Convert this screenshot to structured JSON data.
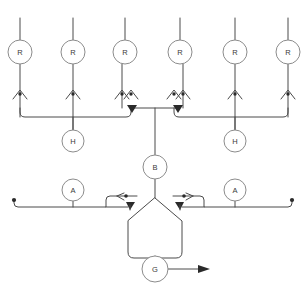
{
  "diagram": {
    "type": "schematic",
    "background_color": "#ffffff",
    "line_color": "#4a4a4a",
    "node_stroke_color": "#8c8c8c",
    "node_fill_color": "#ffffff",
    "label_color": "#3a3a3a",
    "stroke_width": 1
  },
  "nodes": {
    "top_row": [
      {
        "label": "R",
        "cx": 20,
        "cy": 52,
        "r": 12
      },
      {
        "label": "R",
        "cx": 73,
        "cy": 52,
        "r": 12
      },
      {
        "label": "R",
        "cx": 125,
        "cy": 52,
        "r": 12
      },
      {
        "label": "R",
        "cx": 180,
        "cy": 52,
        "r": 12
      },
      {
        "label": "R",
        "cx": 235,
        "cy": 52,
        "r": 12
      },
      {
        "label": "R",
        "cx": 288,
        "cy": 52,
        "r": 12
      }
    ],
    "h_row": [
      {
        "label": "H",
        "cx": 73,
        "cy": 141,
        "r": 11
      },
      {
        "label": "H",
        "cx": 235,
        "cy": 141,
        "r": 11
      }
    ],
    "a_row": [
      {
        "label": "A",
        "cx": 73,
        "cy": 190,
        "r": 11
      },
      {
        "label": "A",
        "cx": 235,
        "cy": 190,
        "r": 11
      }
    ],
    "center": {
      "label": "B",
      "cx": 155,
      "cy": 167,
      "r": 12
    },
    "output": {
      "label": "G",
      "cx": 155,
      "cy": 269,
      "r": 13
    }
  },
  "connectors": {
    "top_stem_top_y": 18,
    "bus_upper_y": 117,
    "bus_lower_y": 207,
    "left_terminal_x": 14,
    "right_terminal_x": 292,
    "arrow_up_y": 93,
    "valve_arrow_count": 6
  },
  "labels": {
    "node_r": "R",
    "node_h": "H",
    "node_a": "A",
    "node_b": "B",
    "node_g": "G"
  }
}
